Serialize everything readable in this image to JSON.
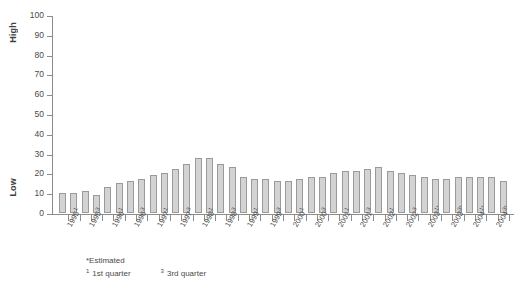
{
  "chart_data": {
    "type": "bar",
    "title": "",
    "subtitle": "",
    "xlabel": "",
    "ylabel": "",
    "y_axis_high_label": "High",
    "y_axis_low_label": "Low",
    "ylim": [
      0,
      100
    ],
    "yticks": [
      0,
      10,
      20,
      30,
      40,
      50,
      60,
      70,
      80,
      90,
      100
    ],
    "grid": false,
    "legend": "none",
    "bar_color": "#d3d3d3",
    "bar_border_color": "#9a9a9a",
    "axis_color": "#8c8c8c",
    "text_color": "#4a4a4a",
    "categories": [
      "1995 Q1",
      "1995 Q2",
      "1995 Q3",
      "1995 Q4",
      "1996 Q1",
      "1996 Q2",
      "1996 Q3",
      "1996 Q4",
      "1997 Q1",
      "1997 Q2",
      "1997 Q3",
      "1997 Q4",
      "1998 Q1",
      "1998 Q2",
      "1998 Q3",
      "1998 Q4",
      "1999 Q1",
      "1999 Q2",
      "1999 Q3",
      "1999 Q4",
      "2000 Q1",
      "2000 Q2",
      "2000 Q3",
      "2000 Q4",
      "2001 Q1",
      "2001 Q2",
      "2001 Q3",
      "2001 Q4",
      "2002 Q1",
      "2002 Q2",
      "2002 Q3",
      "2002 Q4",
      "2003 Q1",
      "2003 Q2",
      "2003 Q3",
      "2003 Q4",
      "2004 Q1",
      "2004 Q2",
      "2004 Q3",
      "2004 Q4"
    ],
    "values": [
      10,
      10,
      11,
      9,
      13,
      15,
      16,
      17,
      19,
      20,
      22,
      25,
      28,
      28,
      25,
      23,
      18,
      17,
      17,
      16,
      16,
      17,
      18,
      18,
      20,
      21,
      21,
      22,
      23,
      21,
      20,
      19,
      18,
      17,
      17,
      18,
      18,
      18,
      18,
      16
    ],
    "xticklabels": [
      {
        "year": "1995",
        "sup": "1"
      },
      {
        "year": "1995",
        "sup": "3"
      },
      {
        "year": "1996",
        "sup": "1"
      },
      {
        "year": "1996",
        "sup": "3"
      },
      {
        "year": "1997",
        "sup": "1"
      },
      {
        "year": "1997",
        "sup": "3"
      },
      {
        "year": "1998",
        "sup": "1"
      },
      {
        "year": "1998",
        "sup": "3"
      },
      {
        "year": "1999",
        "sup": "1"
      },
      {
        "year": "1999",
        "sup": "3"
      },
      {
        "year": "2000",
        "sup": "1"
      },
      {
        "year": "2000",
        "sup": "3"
      },
      {
        "year": "2001",
        "sup": "1"
      },
      {
        "year": "2001",
        "sup": "3"
      },
      {
        "year": "2002",
        "sup": "1"
      },
      {
        "year": "2002",
        "sup": "3"
      },
      {
        "year": "2003",
        "sup": "1*"
      },
      {
        "year": "2003",
        "sup": "3*"
      },
      {
        "year": "2004",
        "sup": "1*"
      },
      {
        "year": "2004",
        "sup": "3*"
      }
    ],
    "annotations": {
      "estimated_note": "*Estimated",
      "q1_marker": "1",
      "q1_note": "1st quarter",
      "q3_marker": "3",
      "q3_note": "3rd quarter"
    }
  }
}
